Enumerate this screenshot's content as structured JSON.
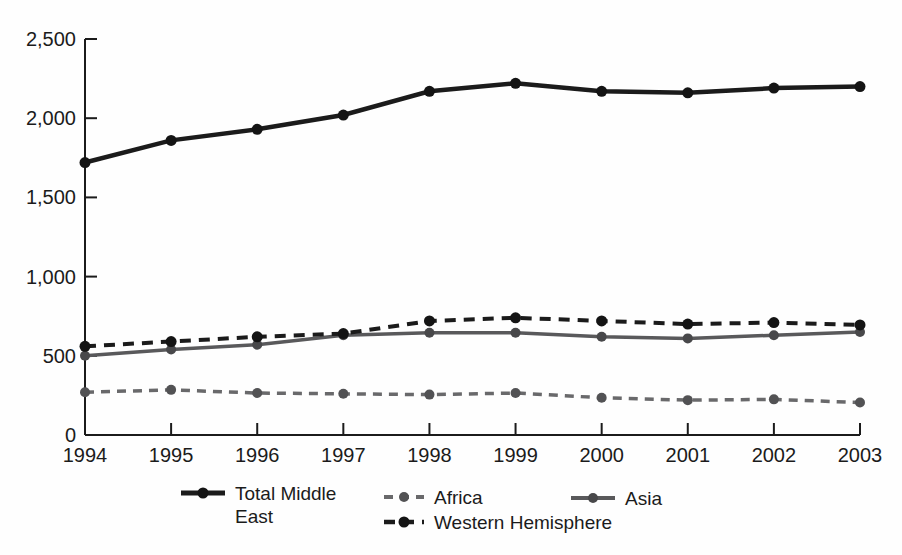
{
  "chart_data": {
    "type": "line",
    "title": "",
    "xlabel": "",
    "ylabel": "",
    "grid": false,
    "legend_position": "bottom",
    "categories": [
      "1994",
      "1995",
      "1996",
      "1997",
      "1998",
      "1999",
      "2000",
      "2001",
      "2002",
      "2003"
    ],
    "y_axis": {
      "min": 0,
      "max": 2500,
      "tick_values": [
        0,
        500,
        1000,
        1500,
        2000,
        2500
      ],
      "tick_labels": [
        "0",
        "500",
        "1,000",
        "1,500",
        "2,000",
        "2,500"
      ]
    },
    "series": [
      {
        "key": "total-middle-east",
        "name": "Total Middle East",
        "color": "#1b1b1b",
        "marker_color": "#141414",
        "dash": "",
        "width": 4.5,
        "marker_radius": 5.5,
        "values": [
          1720,
          1860,
          1930,
          2020,
          2170,
          2220,
          2170,
          2160,
          2190,
          2200
        ]
      },
      {
        "key": "africa",
        "name": "Africa",
        "color": "#69696b",
        "marker_color": "#525254",
        "dash": "9 7",
        "width": 3.5,
        "marker_radius": 5,
        "values": [
          270,
          285,
          265,
          260,
          255,
          265,
          235,
          220,
          225,
          205
        ]
      },
      {
        "key": "western-hemisphere",
        "name": "Western Hemisphere",
        "color": "#1b1b1b",
        "marker_color": "#141414",
        "dash": "11 8",
        "width": 4,
        "marker_radius": 5.5,
        "values": [
          560,
          590,
          620,
          640,
          720,
          740,
          720,
          700,
          710,
          695
        ]
      },
      {
        "key": "asia",
        "name": "Asia",
        "color": "#59595b",
        "marker_color": "#48484a",
        "dash": "",
        "width": 3.5,
        "marker_radius": 5,
        "values": [
          500,
          540,
          570,
          630,
          645,
          645,
          620,
          610,
          630,
          650
        ]
      }
    ]
  }
}
